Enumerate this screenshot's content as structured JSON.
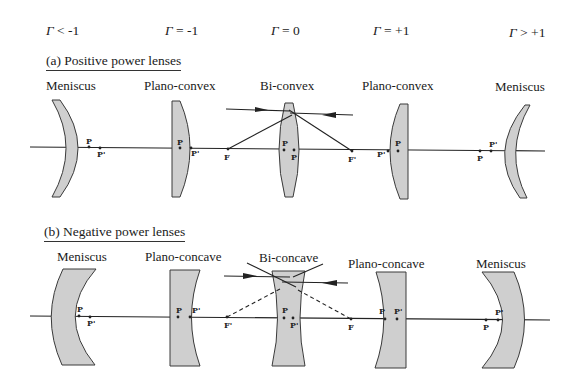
{
  "gamma_labels": [
    {
      "symbol": "Γ",
      "relation": " < -1"
    },
    {
      "symbol": "Γ",
      "relation": " = -1"
    },
    {
      "symbol": "Γ",
      "relation": " = 0"
    },
    {
      "symbol": "Γ",
      "relation": " = +1"
    },
    {
      "symbol": "Γ",
      "relation": " > +1"
    }
  ],
  "positive": {
    "title": "(a) Positive power lenses",
    "lenses": [
      "Meniscus",
      "Plano-convex",
      "Bi-convex",
      "Plano-convex",
      "Meniscus"
    ],
    "focal_labels": {
      "front": "F",
      "back": "F'"
    }
  },
  "negative": {
    "title": "(b) Negative power lenses",
    "lenses": [
      "Meniscus",
      "Plano-concave",
      "Bi-concave",
      "Plano-concave",
      "Meniscus"
    ],
    "focal_labels": {
      "front": "F'",
      "back": "F"
    }
  },
  "principal_point_labels": {
    "P": "P",
    "P_prime": "P'"
  },
  "colors": {
    "lens_fill": "#cfcfcf",
    "stroke": "#222222"
  }
}
